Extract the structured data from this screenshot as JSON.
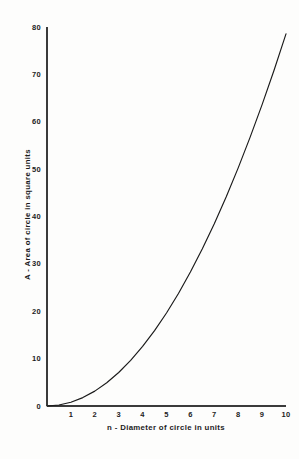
{
  "chart_data": {
    "type": "line",
    "title": "",
    "subtitle": "",
    "xlabel": "n - Diameter of circle in units",
    "ylabel": "A - Area of circle in square units",
    "xlim": [
      0,
      10
    ],
    "ylim": [
      0,
      80
    ],
    "xticks": [
      0,
      1,
      2,
      3,
      4,
      5,
      6,
      7,
      8,
      9,
      10
    ],
    "xtick_labels": [
      "0",
      "1",
      "2",
      "3",
      "4",
      "5",
      "6",
      "7",
      "8",
      "9",
      "10"
    ],
    "yticks": [
      0,
      10,
      20,
      30,
      40,
      50,
      60,
      70,
      80
    ],
    "ytick_labels": [
      "0",
      "10",
      "20",
      "30",
      "40",
      "50",
      "60",
      "70",
      "80"
    ],
    "grid": false,
    "legend": null,
    "legend_position": "none",
    "series": [
      {
        "name": "Area of circle",
        "formula": "A = pi * n^2 / 4",
        "x": [
          0,
          0.5,
          1,
          1.5,
          2,
          2.5,
          3,
          3.5,
          4,
          4.5,
          5,
          5.5,
          6,
          6.5,
          7,
          7.5,
          8,
          8.5,
          9,
          9.5,
          10
        ],
        "values": [
          0,
          0.2,
          0.79,
          1.77,
          3.14,
          4.91,
          7.07,
          9.62,
          12.57,
          15.9,
          19.63,
          23.76,
          28.27,
          33.18,
          38.48,
          44.18,
          50.27,
          56.75,
          63.62,
          70.88,
          78.54
        ],
        "color": "#1a1a1a"
      }
    ],
    "annotations": []
  },
  "axes": {
    "origin_label": "0",
    "line_color": "#3b3b3b"
  },
  "page": {
    "background": "#fdfdfc"
  }
}
